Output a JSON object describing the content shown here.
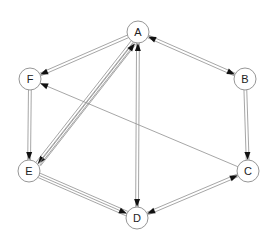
{
  "diagram": {
    "type": "directed-graph",
    "nodes": [
      {
        "id": "A",
        "label": "A"
      },
      {
        "id": "B",
        "label": "B"
      },
      {
        "id": "C",
        "label": "C"
      },
      {
        "id": "D",
        "label": "D"
      },
      {
        "id": "E",
        "label": "E"
      },
      {
        "id": "F",
        "label": "F"
      }
    ],
    "edges": [
      {
        "from": "A",
        "to": "F",
        "style": "tube",
        "arrows": [
          "end"
        ]
      },
      {
        "from": "A",
        "to": "B",
        "style": "tube",
        "arrows": [
          "start",
          "end"
        ]
      },
      {
        "from": "B",
        "to": "C",
        "style": "tube",
        "arrows": [
          "end"
        ]
      },
      {
        "from": "C",
        "to": "F",
        "style": "thin",
        "arrows": [
          "end"
        ]
      },
      {
        "from": "C",
        "to": "D",
        "style": "tube",
        "arrows": [
          "start",
          "end"
        ]
      },
      {
        "from": "E",
        "to": "D",
        "style": "tube-wide",
        "arrows": [
          "end"
        ]
      },
      {
        "from": "F",
        "to": "E",
        "style": "tube",
        "arrows": [
          "end"
        ]
      },
      {
        "from": "A",
        "to": "E",
        "style": "tube-wide",
        "arrows": [
          "end"
        ]
      },
      {
        "from": "E",
        "to": "A",
        "style": "tube",
        "arrows": [
          "end"
        ]
      },
      {
        "from": "A",
        "to": "D",
        "style": "tube",
        "arrows": [
          "start",
          "end"
        ]
      }
    ],
    "colors": {
      "edge": "#8f8f8f",
      "arrowhead": "#111111",
      "node_stroke": "#8a8a8a",
      "node_fill": "#ffffff"
    }
  }
}
